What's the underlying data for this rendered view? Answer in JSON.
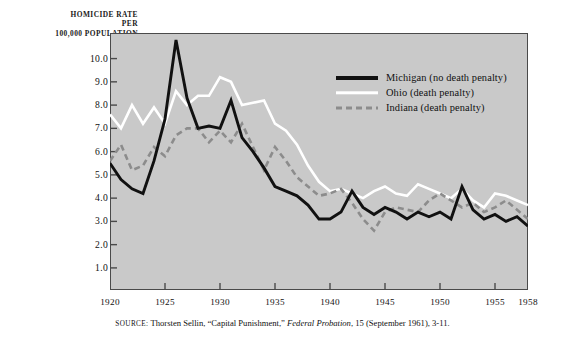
{
  "figure": {
    "axis_title_lines": [
      "HOMICIDE RATE",
      "PER",
      "100,000 POPULATION"
    ],
    "plot_bg_color": "#c9c9c9",
    "frame_color": "#4a4a4a"
  },
  "source": {
    "key": "source:",
    "author": " Thorsten Sellin, “Capital Punishment,” ",
    "journal": "Federal Probation",
    "rest": ", 15 (September 1961), 3-11."
  },
  "legend": {
    "position": "inside-top-right",
    "items": [
      {
        "label": "Michigan (no death penalty)",
        "color": "#111111",
        "style": "solid",
        "swatch": "sw-michigan"
      },
      {
        "label": "Ohio (death penalty)",
        "color": "#ffffff",
        "style": "solid",
        "swatch": "sw-ohio"
      },
      {
        "label": "Indiana (death penalty)",
        "color": "#8c8c8c",
        "style": "dashed",
        "swatch": "sw-indiana"
      }
    ]
  },
  "chart_data": {
    "type": "line",
    "title": "",
    "xlabel": "",
    "ylabel": "HOMICIDE RATE PER 100,000 POPULATION",
    "xlim": [
      1920,
      1958
    ],
    "ylim": [
      0.05,
      11.1
    ],
    "grid": false,
    "y_ticks": [
      1.0,
      2.0,
      3.0,
      4.0,
      5.0,
      6.0,
      7.0,
      8.0,
      9.0,
      10.0
    ],
    "y_tick_labels": [
      "1.0",
      "2.0",
      "3.0",
      "4.0",
      "5.0",
      "6.0",
      "7.0",
      "8.0",
      "9.0",
      "10.0"
    ],
    "x_ticks": [
      1920,
      1925,
      1930,
      1935,
      1940,
      1945,
      1950,
      1955,
      1958
    ],
    "x_tick_labels": [
      "1920",
      "1925",
      "1930",
      "1935",
      "1940",
      "1945",
      "1950",
      "1955",
      "1958"
    ],
    "x": [
      1920,
      1921,
      1922,
      1923,
      1924,
      1925,
      1926,
      1927,
      1928,
      1929,
      1930,
      1931,
      1932,
      1933,
      1934,
      1935,
      1936,
      1937,
      1938,
      1939,
      1940,
      1941,
      1942,
      1943,
      1944,
      1945,
      1946,
      1947,
      1948,
      1949,
      1950,
      1951,
      1952,
      1953,
      1954,
      1955,
      1956,
      1957,
      1958
    ],
    "series": [
      {
        "name": "Michigan (no death penalty)",
        "label": "Michigan (no death penalty)",
        "color": "#111111",
        "style": "solid",
        "values": [
          5.5,
          4.8,
          4.4,
          4.2,
          5.6,
          7.4,
          10.8,
          8.3,
          7.0,
          7.1,
          7.0,
          8.2,
          6.6,
          6.0,
          5.3,
          4.5,
          4.3,
          4.1,
          3.7,
          3.1,
          3.1,
          3.4,
          4.3,
          3.6,
          3.3,
          3.6,
          3.4,
          3.1,
          3.4,
          3.2,
          3.4,
          3.1,
          4.5,
          3.5,
          3.1,
          3.3,
          3.0,
          3.2,
          2.8
        ]
      },
      {
        "name": "Ohio (death penalty)",
        "label": "Ohio (death penalty)",
        "color": "#ffffff",
        "style": "solid",
        "values": [
          7.6,
          7.0,
          8.0,
          7.2,
          7.9,
          7.2,
          8.6,
          8.0,
          8.4,
          8.4,
          9.2,
          9.0,
          8.0,
          8.1,
          8.2,
          7.2,
          6.9,
          6.3,
          5.4,
          4.7,
          4.3,
          4.4,
          4.2,
          4.0,
          4.3,
          4.5,
          4.2,
          4.1,
          4.6,
          4.4,
          4.2,
          4.0,
          4.4,
          3.9,
          3.6,
          4.2,
          4.1,
          3.9,
          3.7
        ]
      },
      {
        "name": "Indiana (death penalty)",
        "label": "Indiana (death penalty)",
        "color": "#8c8c8c",
        "style": "dashed",
        "values": [
          5.6,
          6.3,
          5.2,
          5.4,
          6.2,
          5.8,
          6.7,
          7.0,
          7.0,
          6.4,
          6.9,
          6.4,
          7.2,
          6.2,
          5.2,
          6.2,
          5.6,
          4.9,
          4.5,
          4.1,
          4.2,
          4.4,
          3.8,
          3.1,
          2.6,
          3.4,
          3.6,
          3.5,
          3.4,
          3.9,
          4.2,
          3.9,
          3.6,
          3.8,
          3.4,
          3.6,
          3.9,
          3.5,
          3.1
        ]
      }
    ]
  }
}
